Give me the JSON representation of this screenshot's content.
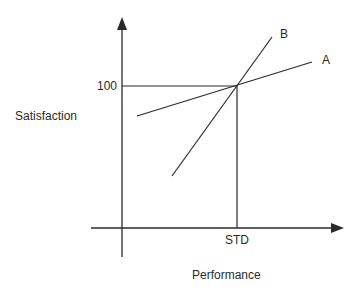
{
  "diagram": {
    "y_axis_label": "Satisfaction",
    "x_axis_label": "Performance",
    "y_tick_label": "100",
    "x_tick_label": "STD",
    "lines": [
      {
        "name": "A",
        "label": "A"
      },
      {
        "name": "B",
        "label": "B"
      }
    ],
    "colors": {
      "ink": "#2a2a2a",
      "background": "#ffffff"
    }
  }
}
